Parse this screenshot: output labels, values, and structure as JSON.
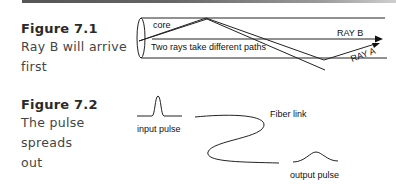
{
  "figures": [
    {
      "title": "Figure 7.1",
      "caption_lines": [
        "Ray B will arrive",
        "first"
      ],
      "diagram": {
        "labels": {
          "core": "core",
          "description": "Two rays take different paths",
          "ray_b": "RAY B",
          "ray_a": "RAY A"
        }
      }
    },
    {
      "title": "Figure 7.2",
      "caption_lines": [
        "The pulse spreads",
        "out"
      ],
      "diagram": {
        "labels": {
          "input": "input pulse",
          "fiber": "Fiber link",
          "output": "output pulse"
        }
      }
    }
  ]
}
